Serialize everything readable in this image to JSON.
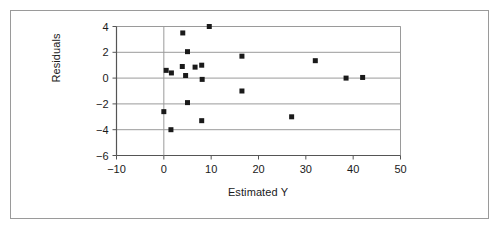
{
  "chart_data": {
    "type": "scatter",
    "title": "",
    "xlabel": "Estimated Y",
    "ylabel": "Residuals",
    "xlim": [
      -10,
      50
    ],
    "ylim": [
      -6,
      4
    ],
    "xticks": [
      -10,
      0,
      10,
      20,
      30,
      40,
      50
    ],
    "yticks": [
      -6,
      -4,
      -2,
      0,
      2,
      4
    ],
    "xtick_labels": [
      "−10",
      "0",
      "10",
      "20",
      "30",
      "40",
      "50"
    ],
    "ytick_labels": [
      "−6",
      "−4",
      "−2",
      "0",
      "2",
      "4"
    ],
    "grid": "horizontal",
    "zero_line_vertical": true,
    "legend": null,
    "marker": "square",
    "marker_color": "#1a1a1a",
    "marker_size": 5,
    "points": [
      {
        "x": 0.5,
        "y": 0.6
      },
      {
        "x": 0.0,
        "y": -2.6
      },
      {
        "x": 1.5,
        "y": -4.0
      },
      {
        "x": 1.6,
        "y": 0.4
      },
      {
        "x": 4.0,
        "y": 3.5
      },
      {
        "x": 5.0,
        "y": 2.05
      },
      {
        "x": 3.9,
        "y": 0.9
      },
      {
        "x": 4.6,
        "y": 0.2
      },
      {
        "x": 5.0,
        "y": -1.9
      },
      {
        "x": 6.6,
        "y": 0.85
      },
      {
        "x": 8.0,
        "y": 1.0
      },
      {
        "x": 8.1,
        "y": -0.1
      },
      {
        "x": 8.0,
        "y": -3.3
      },
      {
        "x": 9.6,
        "y": 4.0
      },
      {
        "x": 16.5,
        "y": 1.7
      },
      {
        "x": 16.5,
        "y": -1.0
      },
      {
        "x": 27.0,
        "y": -3.0
      },
      {
        "x": 32.0,
        "y": 1.35
      },
      {
        "x": 38.5,
        "y": 0.0
      },
      {
        "x": 42.0,
        "y": 0.05
      }
    ]
  },
  "axes": {
    "ylabel": "Residuals",
    "xlabel": "Estimated Y"
  },
  "colors": {
    "marker": "#1a1a1a",
    "axis": "#555555",
    "grid": "#9a9a9a",
    "frame": "#9a9a9a",
    "background": "#ffffff"
  }
}
